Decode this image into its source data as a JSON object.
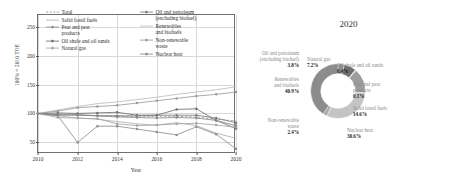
{
  "line_chart": {
    "ylabel": "100% = 2010 TOE",
    "xlabel": "Year",
    "yticks": [
      "50",
      "100",
      "150",
      "200",
      "250"
    ],
    "xticks": [
      "2010",
      "2012",
      "2014",
      "2016",
      "2018",
      "2020"
    ],
    "legend": {
      "left": [
        {
          "label": "Total",
          "key": "dashed-line"
        },
        {
          "label": "Solid fossil fuels",
          "key": "solid-line"
        },
        {
          "label": "Peat and peat\nproducts",
          "key": "line-with-marker"
        },
        {
          "label": "Oil shale and oil sands",
          "key": "line-with-marker"
        },
        {
          "label": "Natural gas",
          "key": "line-with-marker"
        }
      ],
      "right": [
        {
          "label": "Oil and petroleum\n(excluding biofuel)",
          "key": "line-with-marker"
        },
        {
          "label": "Renewables\nand biofuels",
          "key": "solid-line"
        },
        {
          "label": "Non-renewable\nwaste",
          "key": "line-with-marker"
        },
        {
          "label": "Nuclear heat",
          "key": "line-with-marker"
        }
      ]
    }
  },
  "donut_chart": {
    "title": "2020",
    "labels": {
      "oil_petroleum": {
        "name": "Oil and petroleum\n(excluding biofuel)",
        "value": "3.8%"
      },
      "natural_gas": {
        "name": "Natural gas",
        "value": "7.2%"
      },
      "oil_shale": {
        "name": "Oil shale and oil sands",
        "value": "0.4%"
      },
      "peat": {
        "name": "Peat and peat\nproducts",
        "value": "0.1%"
      },
      "solid_fossil": {
        "name": "Solid fossil fuels",
        "value": "14.6%"
      },
      "nuclear": {
        "name": "Nuclear heat",
        "value": "30.6%"
      },
      "non_renewable_waste": {
        "name": "Non-renewable\nwaste",
        "value": "2.4%"
      },
      "renewables": {
        "name": "Renewables\nand biofuels",
        "value": "40.9%"
      }
    }
  },
  "chart_data": [
    {
      "type": "line",
      "title": "",
      "xlabel": "Year",
      "ylabel": "100% = 2010 TOE",
      "xlim": [
        2010,
        2020
      ],
      "ylim": [
        30,
        270
      ],
      "yticks": [
        50,
        100,
        150,
        200,
        250
      ],
      "xticks": [
        2010,
        2012,
        2014,
        2016,
        2018,
        2020
      ],
      "grid": true,
      "legend_position": "upper-left-inside",
      "x": [
        2010,
        2011,
        2012,
        2013,
        2014,
        2015,
        2016,
        2017,
        2018,
        2019,
        2020
      ],
      "series": [
        {
          "name": "Total",
          "color": "#9a9a9a",
          "style": "dashed",
          "values": [
            100,
            98,
            97,
            96,
            95,
            94,
            95,
            95,
            94,
            90,
            87
          ]
        },
        {
          "name": "Solid fossil fuels",
          "color": "#b0b0b0",
          "style": "solid",
          "values": [
            100,
            96,
            92,
            90,
            86,
            82,
            80,
            84,
            79,
            66,
            57
          ]
        },
        {
          "name": "Peat and peat products",
          "color": "#8f8f8f",
          "style": "solid-marker",
          "values": [
            100,
            96,
            50,
            78,
            78,
            73,
            68,
            63,
            77,
            64,
            39
          ]
        },
        {
          "name": "Oil shale and oil sands",
          "color": "#6e6e6e",
          "style": "solid-marker",
          "values": [
            100,
            101,
            100,
            101,
            102,
            97,
            97,
            107,
            108,
            88,
            74
          ]
        },
        {
          "name": "Natural gas",
          "color": "#a5a5a5",
          "style": "solid-marker",
          "values": [
            100,
            93,
            92,
            91,
            82,
            79,
            80,
            82,
            83,
            80,
            76
          ]
        },
        {
          "name": "Oil and petroleum (excluding biofuel)",
          "color": "#7d7d7d",
          "style": "solid-marker",
          "values": [
            100,
            98,
            97,
            96,
            96,
            96,
            97,
            97,
            97,
            92,
            84
          ]
        },
        {
          "name": "Renewables and biofuels",
          "color": "#bdbdbd",
          "style": "solid",
          "values": [
            100,
            106,
            112,
            117,
            120,
            124,
            128,
            133,
            137,
            141,
            146
          ]
        },
        {
          "name": "Non-renewable waste",
          "color": "#9c9c9c",
          "style": "solid-marker",
          "values": [
            100,
            104,
            110,
            112,
            114,
            118,
            122,
            126,
            130,
            133,
            137
          ]
        },
        {
          "name": "Nuclear heat",
          "color": "#8a8a8a",
          "style": "solid-marker",
          "values": [
            100,
            97,
            98,
            96,
            94,
            93,
            92,
            93,
            92,
            88,
            79
          ]
        }
      ]
    },
    {
      "type": "pie",
      "title": "2020",
      "donut": true,
      "labels": [
        "Oil and petroleum (excluding biofuel)",
        "Natural gas",
        "Oil shale and oil sands",
        "Peat and peat products",
        "Solid fossil fuels",
        "Nuclear heat",
        "Non-renewable waste",
        "Renewables and biofuels"
      ],
      "values": [
        3.8,
        7.2,
        0.4,
        0.1,
        14.6,
        30.6,
        2.4,
        40.9
      ],
      "colors": [
        "#8f8f8f",
        "#6f6f6f",
        "#b5b5b5",
        "#cfcfcf",
        "#9d9d9d",
        "#c4c4c4",
        "#a8a8a8",
        "#8c8c8c"
      ]
    }
  ]
}
